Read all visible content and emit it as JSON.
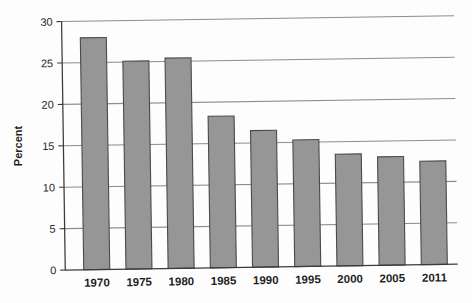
{
  "chart_data": {
    "type": "bar",
    "title": "",
    "subtitle": "",
    "xlabel": "",
    "ylabel": "Percent",
    "categories": [
      "1970",
      "1975",
      "1980",
      "1985",
      "1990",
      "1995",
      "2000",
      "2005",
      "2011"
    ],
    "values": [
      28.0,
      25.1,
      25.4,
      18.3,
      16.5,
      15.3,
      13.5,
      13.1,
      12.5
    ],
    "series": [
      {
        "name": "Percent",
        "values": [
          28.0,
          25.1,
          25.4,
          18.3,
          16.5,
          15.3,
          13.5,
          13.1,
          12.5
        ]
      }
    ],
    "ylim": [
      0,
      30
    ],
    "ytick_values": [
      0,
      5,
      10,
      15,
      20,
      25,
      30
    ],
    "ytick_labels": [
      "0",
      "5",
      "10",
      "15",
      "20",
      "25",
      "30"
    ],
    "xtick_labels": [
      "1970",
      "1975",
      "1980",
      "1985",
      "1990",
      "1995",
      "2000",
      "2005",
      "2011"
    ],
    "grid": true,
    "grid_axis": "y",
    "legend": false,
    "legend_position": "none",
    "bar_color": "#969696",
    "bar_edge_color": "#4a4a4a",
    "gridline_color": "#8d8d8d",
    "axis_color": "#3a3a3a",
    "background_color": "#fdfdfd",
    "annotations": []
  },
  "figure": {
    "axis_title_y": "Percent"
  }
}
